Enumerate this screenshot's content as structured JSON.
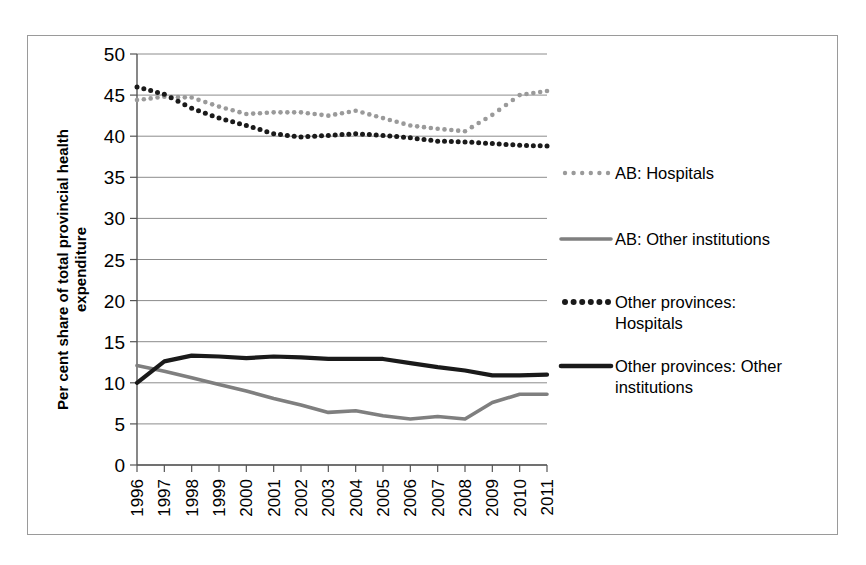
{
  "chart_data": {
    "type": "line",
    "title": "",
    "xlabel": "",
    "ylabel": "Per cent share of total provincial health expenditure",
    "ylabel_line1": "Per cent share of total provincial health",
    "ylabel_line2": "expenditure",
    "ylim": [
      0,
      50
    ],
    "ystep": 5,
    "grid": true,
    "legend_position": "right",
    "categories": [
      "1996",
      "1997",
      "1998",
      "1999",
      "2000",
      "2001",
      "2002",
      "2003",
      "2004",
      "2005",
      "2006",
      "2007",
      "2008",
      "2009",
      "2010",
      "2011"
    ],
    "yticks": [
      "0",
      "5",
      "10",
      "15",
      "20",
      "25",
      "30",
      "35",
      "40",
      "45",
      "50"
    ],
    "series": [
      {
        "name": "AB: Hospitals",
        "style": "dotted",
        "color": "#9a9a9a",
        "values": [
          44.4,
          44.8,
          44.7,
          43.6,
          42.7,
          42.9,
          42.9,
          42.5,
          43.1,
          42.2,
          41.3,
          40.9,
          40.6,
          42.6,
          45.0,
          45.5
        ]
      },
      {
        "name": "AB: Other institutions",
        "style": "solid",
        "color": "#7f7f7f",
        "values": [
          12.1,
          11.4,
          10.6,
          9.8,
          9.0,
          8.1,
          7.3,
          6.4,
          6.6,
          6.0,
          5.6,
          5.9,
          5.6,
          7.6,
          8.6,
          8.6
        ]
      },
      {
        "name": "Other provinces: Hospitals",
        "style": "dotted",
        "color": "#1a1a1a",
        "values": [
          46.0,
          45.1,
          43.4,
          42.2,
          41.3,
          40.3,
          39.9,
          40.1,
          40.3,
          40.1,
          39.8,
          39.4,
          39.3,
          39.1,
          38.9,
          38.8
        ]
      },
      {
        "name": "Other provinces: Other institutions",
        "style": "solid",
        "color": "#1a1a1a",
        "values": [
          10.0,
          12.6,
          13.3,
          13.2,
          13.0,
          13.2,
          13.1,
          12.9,
          12.9,
          12.9,
          12.4,
          11.9,
          11.5,
          10.9,
          10.9,
          11.0
        ]
      }
    ]
  },
  "legend": {
    "items": [
      {
        "label": "AB: Hospitals",
        "marker": "dotted-gray"
      },
      {
        "label": "AB: Other institutions",
        "marker": "solid-gray"
      },
      {
        "label_line1": "Other provinces:",
        "label_line2": "Hospitals",
        "marker": "dotted-black"
      },
      {
        "label_line1": "Other provinces: Other",
        "label_line2": "institutions",
        "marker": "solid-black"
      }
    ]
  }
}
